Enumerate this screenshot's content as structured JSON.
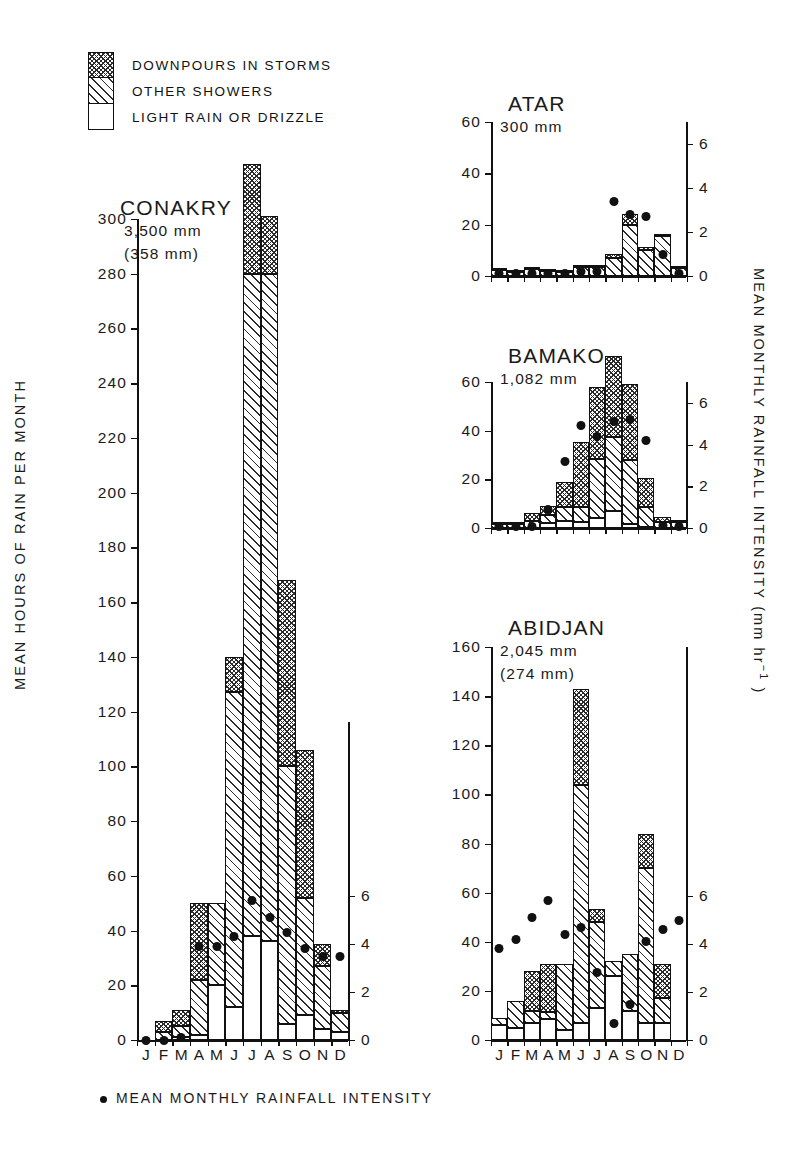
{
  "figure": {
    "y_axis_left_label": "MEAN HOURS OF RAIN PER MONTH",
    "y_axis_right_label": "MEAN MONTHLY RAINFALL INTENSITY (mm hr",
    "y_axis_right_exponent": "−1",
    "y_axis_right_close": " )",
    "caption": "MEAN MONTHLY RAINFALL INTENSITY",
    "months": [
      "J",
      "F",
      "M",
      "A",
      "M",
      "J",
      "J",
      "A",
      "S",
      "O",
      "N",
      "D"
    ],
    "colors": {
      "ink": "#111111",
      "background": "#ffffff"
    }
  },
  "legend": {
    "items": [
      {
        "label": "DOWNPOURS IN STORMS",
        "swatch": "cross-hatch"
      },
      {
        "label": "OTHER SHOWERS",
        "swatch": "diagonal-hatch"
      },
      {
        "label": "LIGHT RAIN OR DRIZZLE",
        "swatch": "white"
      }
    ]
  },
  "chart_data": [
    {
      "type": "bar",
      "title": "CONAKRY",
      "subtitle_1": "3,500 mm",
      "subtitle_2": "(358 mm)",
      "xlabel": "",
      "ylabel": "MEAN HOURS OF RAIN PER MONTH",
      "categories": [
        "J",
        "F",
        "M",
        "A",
        "M",
        "J",
        "J",
        "A",
        "S",
        "O",
        "N",
        "D"
      ],
      "ylim": [
        0,
        300
      ],
      "yticks": [
        0,
        20,
        40,
        60,
        80,
        100,
        120,
        140,
        160,
        180,
        200,
        220,
        240,
        260,
        280,
        300
      ],
      "y2lim": [
        0,
        7
      ],
      "y2ticks": [
        0,
        2,
        4,
        6
      ],
      "y2label": "MEAN MONTHLY RAINFALL INTENSITY (mm hr-1)",
      "grid": false,
      "series": [
        {
          "name": "LIGHT RAIN OR DRIZZLE",
          "values": [
            0,
            0,
            1,
            2,
            20,
            12,
            38,
            36,
            6,
            9,
            4,
            3
          ]
        },
        {
          "name": "OTHER SHOWERS",
          "values": [
            0,
            3,
            4,
            20,
            30,
            115,
            242,
            244,
            94,
            43,
            23,
            7
          ]
        },
        {
          "name": "DOWNPOURS IN STORMS",
          "values": [
            0,
            4,
            6,
            28,
            0,
            13,
            40,
            21,
            68,
            54,
            8,
            1
          ]
        }
      ],
      "totals": [
        0,
        7,
        11,
        50,
        50,
        140,
        320,
        301,
        168,
        106,
        35,
        11
      ],
      "intensity": [
        0,
        0,
        0.1,
        3.9,
        3.9,
        4.3,
        5.8,
        5.1,
        4.5,
        3.8,
        3.5,
        3.5
      ]
    },
    {
      "type": "bar",
      "title": "ATAR",
      "subtitle_1": "300 mm",
      "subtitle_2": "",
      "categories": [
        "J",
        "F",
        "M",
        "A",
        "M",
        "J",
        "J",
        "A",
        "S",
        "O",
        "N",
        "D"
      ],
      "ylim": [
        0,
        60
      ],
      "yticks": [
        0,
        20,
        40,
        60
      ],
      "y2lim": [
        0,
        7
      ],
      "y2ticks": [
        0,
        2,
        4,
        6
      ],
      "grid": false,
      "series": [
        {
          "name": "LIGHT RAIN OR DRIZZLE",
          "values": [
            0,
            0,
            0,
            0,
            0,
            0,
            0,
            0,
            0,
            0,
            0,
            0
          ]
        },
        {
          "name": "OTHER SHOWERS",
          "values": [
            2.3,
            1.6,
            2.6,
            2.0,
            1.6,
            3.4,
            3.4,
            7.0,
            20.0,
            10.0,
            15.6,
            3.0
          ]
        },
        {
          "name": "DOWNPOURS IN STORMS",
          "values": [
            0.4,
            0.4,
            0.6,
            0.4,
            0.4,
            1.0,
            1.0,
            1.4,
            4.0,
            1.4,
            0.4,
            1.0
          ]
        }
      ],
      "totals": [
        2.7,
        2.0,
        3.2,
        2.4,
        2.0,
        4.4,
        4.4,
        8.4,
        24.0,
        11.4,
        16.0,
        4.0
      ],
      "intensity": [
        0.1,
        0.1,
        0.1,
        0.1,
        0.1,
        0.2,
        0.2,
        3.4,
        2.8,
        2.7,
        1.0,
        0.1
      ]
    },
    {
      "type": "bar",
      "title": "BAMAKO",
      "subtitle_1": "1,082 mm",
      "subtitle_2": "",
      "categories": [
        "J",
        "F",
        "M",
        "A",
        "M",
        "J",
        "J",
        "A",
        "S",
        "O",
        "N",
        "D"
      ],
      "ylim": [
        0,
        60
      ],
      "yticks": [
        0,
        20,
        40,
        60
      ],
      "y2lim": [
        0,
        7
      ],
      "y2ticks": [
        0,
        2,
        4,
        6
      ],
      "grid": false,
      "series": [
        {
          "name": "LIGHT RAIN OR DRIZZLE",
          "values": [
            0,
            0,
            0,
            2.0,
            3.0,
            2.5,
            4.0,
            7.0,
            1.5,
            0.5,
            0,
            0
          ]
        },
        {
          "name": "OTHER SHOWERS",
          "values": [
            1.6,
            1.6,
            2.8,
            3.5,
            5.5,
            6.0,
            24.5,
            30.5,
            26.5,
            8.0,
            2.5,
            2.5
          ]
        },
        {
          "name": "DOWNPOURS IN STORMS",
          "values": [
            0.4,
            0.4,
            3.2,
            3.5,
            10.5,
            27.0,
            29.5,
            33.0,
            31.0,
            12.0,
            2.0,
            0.5
          ]
        }
      ],
      "totals": [
        2.0,
        2.0,
        6.0,
        9.0,
        19.0,
        35.5,
        58.0,
        70.5,
        59.0,
        20.5,
        4.5,
        3.0
      ],
      "intensity": [
        0.05,
        0.05,
        0.05,
        0.9,
        3.2,
        4.9,
        4.4,
        5.1,
        5.2,
        4.2,
        0.1,
        0.05
      ]
    },
    {
      "type": "bar",
      "title": "ABIDJAN",
      "subtitle_1": "2,045 mm",
      "subtitle_2": "(274 mm)",
      "categories": [
        "J",
        "F",
        "M",
        "A",
        "M",
        "J",
        "J",
        "A",
        "S",
        "O",
        "N",
        "D"
      ],
      "ylim": [
        0,
        160
      ],
      "yticks": [
        0,
        20,
        40,
        60,
        80,
        100,
        120,
        140,
        160
      ],
      "y2lim": [
        0,
        7
      ],
      "y2ticks": [
        0,
        2,
        4,
        6
      ],
      "grid": false,
      "series": [
        {
          "name": "LIGHT RAIN OR DRIZZLE",
          "values": [
            6,
            5,
            7,
            8.5,
            4,
            7,
            13,
            26,
            12,
            7,
            7,
            0
          ]
        },
        {
          "name": "OTHER SHOWERS",
          "values": [
            3,
            11,
            5,
            3,
            27,
            97,
            35,
            6,
            23,
            63,
            10,
            0
          ]
        },
        {
          "name": "DOWNPOURS IN STORMS",
          "values": [
            0,
            0,
            16,
            19.5,
            0,
            39,
            5.5,
            0,
            0,
            14,
            14,
            0
          ]
        }
      ],
      "totals": [
        9,
        16,
        28,
        31,
        31,
        143,
        53.5,
        32,
        35,
        84,
        31,
        0
      ],
      "intensity": [
        3.8,
        4.2,
        5.1,
        5.8,
        4.4,
        4.7,
        2.8,
        0.7,
        1.5,
        4.1,
        4.6,
        5.0
      ]
    }
  ]
}
